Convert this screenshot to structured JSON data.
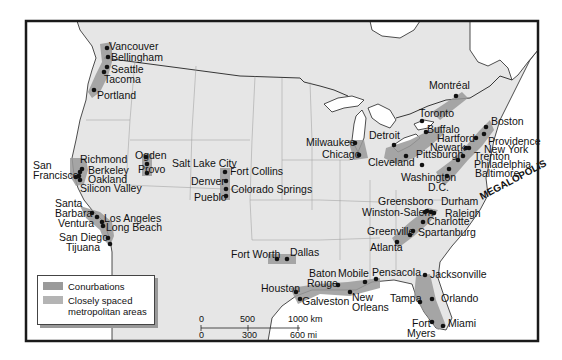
{
  "map": {
    "title": "North American megalopolises and conurbations",
    "region_label": "MEGALOPOLIS",
    "colors": {
      "land": "#e6e6e6",
      "water": "#ffffff",
      "frame": "#1a1a1a",
      "conurbation": "#9a9a9a",
      "metro_area": "#b4b4b4",
      "city_dot": "#111111"
    },
    "cities": [
      {
        "name": "Vancouver",
        "x": 107,
        "y": 48
      },
      {
        "name": "Bellingham",
        "x": 108,
        "y": 57
      },
      {
        "name": "Seattle",
        "x": 107,
        "y": 67
      },
      {
        "name": "Tacoma",
        "x": 104,
        "y": 72
      },
      {
        "name": "Portland",
        "x": 94,
        "y": 90
      },
      {
        "name": "Richmond",
        "x": 82,
        "y": 169
      },
      {
        "name": "Berkeley",
        "x": 80,
        "y": 172
      },
      {
        "name": "Oakland",
        "x": 79,
        "y": 176
      },
      {
        "name": "San Francisco",
        "x": 76,
        "y": 177
      },
      {
        "name": "Silicon Valley",
        "x": 80,
        "y": 180
      },
      {
        "name": "Ogden",
        "x": 146,
        "y": 157
      },
      {
        "name": "Salt Lake City",
        "x": 147,
        "y": 164
      },
      {
        "name": "Provo",
        "x": 147,
        "y": 173
      },
      {
        "name": "Fort Collins",
        "x": 225,
        "y": 172
      },
      {
        "name": "Denver",
        "x": 226,
        "y": 181
      },
      {
        "name": "Colorado Springs",
        "x": 226,
        "y": 189
      },
      {
        "name": "Pueblo",
        "x": 226,
        "y": 196
      },
      {
        "name": "Santa Barbara",
        "x": 92,
        "y": 213
      },
      {
        "name": "Ventura",
        "x": 97,
        "y": 217
      },
      {
        "name": "Los Angeles",
        "x": 102,
        "y": 222
      },
      {
        "name": "Long Beach",
        "x": 103,
        "y": 226
      },
      {
        "name": "San Diego",
        "x": 108,
        "y": 238
      },
      {
        "name": "Tijuana",
        "x": 110,
        "y": 244
      },
      {
        "name": "Fort Worth",
        "x": 277,
        "y": 259
      },
      {
        "name": "Dallas",
        "x": 287,
        "y": 259
      },
      {
        "name": "Houston",
        "x": 296,
        "y": 292
      },
      {
        "name": "Galveston",
        "x": 300,
        "y": 299
      },
      {
        "name": "Baton Rouge",
        "x": 338,
        "y": 285
      },
      {
        "name": "New Orleans",
        "x": 350,
        "y": 292
      },
      {
        "name": "Mobile",
        "x": 365,
        "y": 282
      },
      {
        "name": "Pensacola",
        "x": 376,
        "y": 279
      },
      {
        "name": "Jacksonville",
        "x": 425,
        "y": 275
      },
      {
        "name": "Tampa",
        "x": 420,
        "y": 302
      },
      {
        "name": "Orlando",
        "x": 432,
        "y": 299
      },
      {
        "name": "Fort Myers",
        "x": 432,
        "y": 322
      },
      {
        "name": "Miami",
        "x": 443,
        "y": 326
      },
      {
        "name": "Milwaukee",
        "x": 355,
        "y": 143
      },
      {
        "name": "Chicago",
        "x": 359,
        "y": 155
      },
      {
        "name": "Detroit",
        "x": 394,
        "y": 145
      },
      {
        "name": "Cleveland",
        "x": 406,
        "y": 156
      },
      {
        "name": "Toronto",
        "x": 422,
        "y": 121
      },
      {
        "name": "Buffalo",
        "x": 426,
        "y": 132
      },
      {
        "name": "Montréal",
        "x": 456,
        "y": 96
      },
      {
        "name": "Pittsburgh",
        "x": 422,
        "y": 165
      },
      {
        "name": "Boston",
        "x": 486,
        "y": 127
      },
      {
        "name": "Providence",
        "x": 484,
        "y": 134
      },
      {
        "name": "Hartford",
        "x": 476,
        "y": 138
      },
      {
        "name": "New York",
        "x": 469,
        "y": 148
      },
      {
        "name": "Newark",
        "x": 466,
        "y": 148
      },
      {
        "name": "Trenton",
        "x": 463,
        "y": 156
      },
      {
        "name": "Philadelphia",
        "x": 458,
        "y": 160
      },
      {
        "name": "Baltimore",
        "x": 449,
        "y": 169
      },
      {
        "name": "Washington D.C.",
        "x": 447,
        "y": 176
      },
      {
        "name": "Greensboro",
        "x": 427,
        "y": 211
      },
      {
        "name": "Winston-Salem",
        "x": 425,
        "y": 212
      },
      {
        "name": "Durham",
        "x": 431,
        "y": 212
      },
      {
        "name": "Raleigh",
        "x": 434,
        "y": 213
      },
      {
        "name": "Charlotte",
        "x": 423,
        "y": 222
      },
      {
        "name": "Greenville",
        "x": 413,
        "y": 231
      },
      {
        "name": "Spartanburg",
        "x": 410,
        "y": 235
      },
      {
        "name": "Atlanta",
        "x": 397,
        "y": 242
      }
    ],
    "labels": [
      {
        "text": "Vancouver",
        "x": 109,
        "y": 50
      },
      {
        "text": "Bellingham",
        "x": 111,
        "y": 61
      },
      {
        "text": "Seattle",
        "x": 111,
        "y": 73
      },
      {
        "text": "Tacoma",
        "x": 104,
        "y": 83
      },
      {
        "text": "Portland",
        "x": 97,
        "y": 99
      },
      {
        "text": "Richmond",
        "x": 80,
        "y": 163
      },
      {
        "text": "San",
        "x": 33,
        "y": 169
      },
      {
        "text": "Francisco",
        "x": 33,
        "y": 179
      },
      {
        "text": "Berkeley",
        "x": 88,
        "y": 174
      },
      {
        "text": "Oakland",
        "x": 88,
        "y": 183
      },
      {
        "text": "Silicon Valley",
        "x": 80,
        "y": 192
      },
      {
        "text": "Ogden",
        "x": 135,
        "y": 159
      },
      {
        "text": "Salt Lake City",
        "x": 172,
        "y": 167
      },
      {
        "text": "Provo",
        "x": 138,
        "y": 173
      },
      {
        "text": "Fort Collins",
        "x": 230,
        "y": 175
      },
      {
        "text": "Denver",
        "x": 191,
        "y": 185
      },
      {
        "text": "Colorado Springs",
        "x": 231,
        "y": 193
      },
      {
        "text": "Pueblo",
        "x": 194,
        "y": 201
      },
      {
        "text": "Santa",
        "x": 55,
        "y": 207
      },
      {
        "text": "Barbara",
        "x": 55,
        "y": 217
      },
      {
        "text": "Ventura",
        "x": 58,
        "y": 227
      },
      {
        "text": "Los Angeles",
        "x": 104,
        "y": 222
      },
      {
        "text": "Long Beach",
        "x": 106,
        "y": 231
      },
      {
        "text": "San Diego",
        "x": 59,
        "y": 241
      },
      {
        "text": "Tijuana",
        "x": 66,
        "y": 251
      },
      {
        "text": "Fort Worth",
        "x": 231,
        "y": 258
      },
      {
        "text": "Dallas",
        "x": 290,
        "y": 256
      },
      {
        "text": "Houston",
        "x": 261,
        "y": 292
      },
      {
        "text": "Galveston",
        "x": 302,
        "y": 305
      },
      {
        "text": "Baton",
        "x": 309,
        "y": 277
      },
      {
        "text": "Rouge",
        "x": 307,
        "y": 287
      },
      {
        "text": "Mobile",
        "x": 338,
        "y": 277
      },
      {
        "text": "Pensacola",
        "x": 372,
        "y": 276
      },
      {
        "text": "New",
        "x": 352,
        "y": 301
      },
      {
        "text": "Orleans",
        "x": 352,
        "y": 311
      },
      {
        "text": "Jacksonville",
        "x": 430,
        "y": 278
      },
      {
        "text": "Tampa",
        "x": 390,
        "y": 302
      },
      {
        "text": "Orlando",
        "x": 441,
        "y": 302
      },
      {
        "text": "Fort",
        "x": 412,
        "y": 327
      },
      {
        "text": "Myers",
        "x": 407,
        "y": 337
      },
      {
        "text": "Miami",
        "x": 448,
        "y": 327
      },
      {
        "text": "Milwaukee",
        "x": 306,
        "y": 146
      },
      {
        "text": "Chicago",
        "x": 322,
        "y": 158
      },
      {
        "text": "Detroit",
        "x": 369,
        "y": 139
      },
      {
        "text": "Cleveland",
        "x": 368,
        "y": 166
      },
      {
        "text": "Toronto",
        "x": 419,
        "y": 117
      },
      {
        "text": "Buffalo",
        "x": 427,
        "y": 133
      },
      {
        "text": "Montréal",
        "x": 429,
        "y": 89
      },
      {
        "text": "Pittsburgh",
        "x": 416,
        "y": 158
      },
      {
        "text": "Washington",
        "x": 401,
        "y": 181
      },
      {
        "text": "D.C.",
        "x": 428,
        "y": 191
      },
      {
        "text": "Boston",
        "x": 491,
        "y": 125
      },
      {
        "text": "Hartford",
        "x": 437,
        "y": 142
      },
      {
        "text": "Providence",
        "x": 488,
        "y": 145
      },
      {
        "text": "Newark",
        "x": 430,
        "y": 151
      },
      {
        "text": "New York",
        "x": 484,
        "y": 153
      },
      {
        "text": "Trenton",
        "x": 474,
        "y": 160
      },
      {
        "text": "Philadelphia",
        "x": 474,
        "y": 168
      },
      {
        "text": "Baltimore",
        "x": 475,
        "y": 177
      },
      {
        "text": "Greensboro",
        "x": 378,
        "y": 205
      },
      {
        "text": "Durham",
        "x": 441,
        "y": 205
      },
      {
        "text": "Winston-Salem",
        "x": 362,
        "y": 216
      },
      {
        "text": "Raleigh",
        "x": 445,
        "y": 217
      },
      {
        "text": "Charlotte",
        "x": 427,
        "y": 225
      },
      {
        "text": "Greenville",
        "x": 367,
        "y": 235
      },
      {
        "text": "Spartanburg",
        "x": 418,
        "y": 236
      },
      {
        "text": "Atlanta",
        "x": 370,
        "y": 251
      }
    ]
  },
  "legend": {
    "items": [
      {
        "label": "Conurbations",
        "color": "#9a9a9a"
      },
      {
        "label_line1": "Closely spaced",
        "label_line2": "metropolitan areas",
        "color": "#b4b4b4"
      }
    ]
  },
  "scale_bar": {
    "km_ticks": [
      "0",
      "500",
      "1000 km"
    ],
    "mi_ticks": [
      "0",
      "300",
      "600 mi"
    ]
  }
}
